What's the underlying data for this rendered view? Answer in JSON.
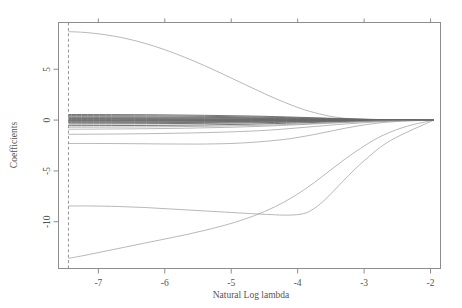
{
  "chart_data": {
    "type": "line",
    "title": "",
    "xlabel": "Natural Log lambda",
    "ylabel": "Coefficients",
    "xlim": [
      -7.6,
      -1.85
    ],
    "ylim": [
      -14.6,
      9.6
    ],
    "grid": false,
    "legend": false,
    "legend_position": "none",
    "xticks": [
      -7,
      -6,
      -5,
      -4,
      -3,
      -2
    ],
    "xtick_labels": [
      "-7",
      "-6",
      "-5",
      "-4",
      "-3",
      "-2"
    ],
    "yticks": [
      5,
      0,
      -5,
      -10
    ],
    "ytick_labels": [
      "5",
      "0",
      "-5",
      "-10"
    ],
    "top_axis_ticks": [
      -7,
      -6,
      -5,
      -4,
      -3,
      -2
    ],
    "top_axis_labels": [
      "",
      "",
      "",
      "",
      "",
      ""
    ],
    "annotations": [
      {
        "name": "lambda-min-line",
        "type": "vline",
        "x": -7.45,
        "style": "dashed"
      }
    ],
    "series": [
      {
        "name": "coef_1_large_positive",
        "x": [
          -7.45,
          -7.2,
          -6.9,
          -6.6,
          -6.3,
          -6.0,
          -5.7,
          -5.4,
          -5.1,
          -4.8,
          -4.5,
          -4.2,
          -3.9,
          -3.6,
          -3.35,
          -3.1,
          -2.8,
          -2.4,
          -1.95
        ],
        "values": [
          8.7,
          8.62,
          8.4,
          8.05,
          7.55,
          6.92,
          6.18,
          5.35,
          4.45,
          3.52,
          2.6,
          1.75,
          1.02,
          0.5,
          0.22,
          0.1,
          0.04,
          0.01,
          0.0
        ]
      },
      {
        "name": "coef_2_deep_negative",
        "x": [
          -7.45,
          -7.2,
          -6.9,
          -6.6,
          -6.3,
          -6.0,
          -5.7,
          -5.4,
          -5.1,
          -4.8,
          -4.5,
          -4.2,
          -3.9,
          -3.6,
          -3.3,
          -3.0,
          -2.7,
          -2.35,
          -1.95
        ],
        "values": [
          -13.6,
          -13.3,
          -12.9,
          -12.5,
          -12.1,
          -11.7,
          -11.3,
          -10.85,
          -10.35,
          -9.75,
          -9.0,
          -8.05,
          -6.85,
          -5.4,
          -3.9,
          -2.55,
          -1.45,
          -0.6,
          0.0
        ]
      },
      {
        "name": "coef_3_mid_negative",
        "x": [
          -7.45,
          -7.1,
          -6.7,
          -6.3,
          -5.9,
          -5.5,
          -5.1,
          -4.7,
          -4.4,
          -4.15,
          -3.95,
          -3.8,
          -3.6,
          -3.3,
          -3.0,
          -2.6,
          -1.95
        ],
        "values": [
          -8.45,
          -8.45,
          -8.5,
          -8.6,
          -8.75,
          -8.9,
          -9.05,
          -9.2,
          -9.3,
          -9.35,
          -9.25,
          -8.9,
          -7.9,
          -5.9,
          -4.0,
          -2.0,
          0.0
        ]
      },
      {
        "name": "coef_4_small_negative",
        "x": [
          -7.45,
          -7.0,
          -6.5,
          -6.0,
          -5.5,
          -5.0,
          -4.6,
          -4.2,
          -3.9,
          -3.6,
          -3.3,
          -3.0,
          -2.6,
          -1.95
        ],
        "values": [
          -2.3,
          -2.3,
          -2.32,
          -2.35,
          -2.36,
          -2.3,
          -2.15,
          -1.9,
          -1.6,
          -1.22,
          -0.82,
          -0.48,
          -0.18,
          0.0
        ]
      },
      {
        "name": "coef_5_small_negative",
        "x": [
          -7.45,
          -6.9,
          -6.3,
          -5.7,
          -5.1,
          -4.6,
          -4.2,
          -3.8,
          -3.4,
          -3.0,
          -2.5,
          -1.95
        ],
        "values": [
          -1.4,
          -1.38,
          -1.34,
          -1.28,
          -1.18,
          -1.05,
          -0.88,
          -0.66,
          -0.44,
          -0.26,
          -0.08,
          0.0
        ]
      },
      {
        "name": "coef_6_small_negative",
        "x": [
          -7.45,
          -6.9,
          -6.3,
          -5.7,
          -5.1,
          -4.5,
          -4.0,
          -3.5,
          -3.0,
          -2.5,
          -1.95
        ],
        "values": [
          -0.9,
          -0.88,
          -0.85,
          -0.8,
          -0.72,
          -0.6,
          -0.46,
          -0.3,
          -0.16,
          -0.05,
          0.0
        ]
      },
      {
        "name": "coef_7_near_zero",
        "x": [
          -7.45,
          -6.8,
          -6.1,
          -5.4,
          -4.7,
          -4.0,
          -3.4,
          -2.8,
          -1.95
        ],
        "values": [
          -0.55,
          -0.54,
          -0.52,
          -0.48,
          -0.4,
          -0.28,
          -0.16,
          -0.06,
          0.0
        ]
      },
      {
        "name": "coef_8_near_zero",
        "x": [
          -7.45,
          -6.8,
          -6.1,
          -5.4,
          -4.7,
          -4.0,
          -3.4,
          -2.8,
          -1.95
        ],
        "values": [
          -0.38,
          -0.37,
          -0.35,
          -0.32,
          -0.27,
          -0.19,
          -0.11,
          -0.04,
          0.0
        ]
      },
      {
        "name": "coef_9_near_zero",
        "x": [
          -7.45,
          -6.8,
          -6.1,
          -5.4,
          -4.7,
          -4.0,
          -3.4,
          -2.8,
          -1.95
        ],
        "values": [
          -0.26,
          -0.26,
          -0.25,
          -0.23,
          -0.19,
          -0.14,
          -0.08,
          -0.03,
          0.0
        ]
      },
      {
        "name": "coef_10_near_zero",
        "x": [
          -7.45,
          -6.8,
          -6.1,
          -5.4,
          -4.7,
          -4.0,
          -3.4,
          -2.8,
          -1.95
        ],
        "values": [
          -0.18,
          -0.18,
          -0.17,
          -0.15,
          -0.13,
          -0.09,
          -0.05,
          -0.02,
          0.0
        ]
      },
      {
        "name": "coef_11_near_zero",
        "x": [
          -7.45,
          -6.8,
          -6.1,
          -5.4,
          -4.7,
          -4.0,
          -3.4,
          -2.8,
          -1.95
        ],
        "values": [
          -0.1,
          -0.1,
          -0.09,
          -0.08,
          -0.07,
          -0.05,
          -0.03,
          -0.01,
          0.0
        ]
      },
      {
        "name": "coef_12_near_zero",
        "x": [
          -7.45,
          -6.8,
          -6.1,
          -5.4,
          -4.7,
          -4.0,
          -3.4,
          -2.8,
          -1.95
        ],
        "values": [
          -0.05,
          -0.05,
          -0.05,
          -0.04,
          -0.03,
          -0.02,
          -0.01,
          0.0,
          0.0
        ]
      },
      {
        "name": "coef_13_near_zero",
        "x": [
          -7.45,
          -6.8,
          -6.1,
          -5.4,
          -4.7,
          -4.0,
          -3.4,
          -2.8,
          -1.95
        ],
        "values": [
          0.02,
          0.02,
          0.02,
          0.02,
          0.01,
          0.01,
          0.0,
          0.0,
          0.0
        ]
      },
      {
        "name": "coef_14_near_zero",
        "x": [
          -7.45,
          -6.8,
          -6.1,
          -5.4,
          -4.7,
          -4.0,
          -3.4,
          -2.8,
          -1.95
        ],
        "values": [
          0.08,
          0.08,
          0.07,
          0.07,
          0.06,
          0.04,
          0.02,
          0.01,
          0.0
        ]
      },
      {
        "name": "coef_15_near_zero",
        "x": [
          -7.45,
          -6.8,
          -6.1,
          -5.4,
          -4.7,
          -4.0,
          -3.4,
          -2.8,
          -1.95
        ],
        "values": [
          0.15,
          0.15,
          0.14,
          0.13,
          0.11,
          0.08,
          0.04,
          0.02,
          0.0
        ]
      },
      {
        "name": "coef_16_near_zero",
        "x": [
          -7.45,
          -6.8,
          -6.1,
          -5.4,
          -4.7,
          -4.0,
          -3.4,
          -2.8,
          -1.95
        ],
        "values": [
          0.23,
          0.23,
          0.22,
          0.2,
          0.17,
          0.12,
          0.07,
          0.03,
          0.0
        ]
      },
      {
        "name": "coef_17_near_zero",
        "x": [
          -7.45,
          -6.8,
          -6.1,
          -5.4,
          -4.7,
          -4.0,
          -3.4,
          -2.8,
          -1.95
        ],
        "values": [
          0.32,
          0.32,
          0.3,
          0.27,
          0.23,
          0.16,
          0.09,
          0.04,
          0.0
        ]
      },
      {
        "name": "coef_18_near_zero",
        "x": [
          -7.45,
          -6.8,
          -6.1,
          -5.4,
          -4.7,
          -4.0,
          -3.4,
          -2.8,
          -1.95
        ],
        "values": [
          0.44,
          0.43,
          0.41,
          0.37,
          0.31,
          0.22,
          0.13,
          0.05,
          0.0
        ]
      },
      {
        "name": "coef_19_near_zero",
        "x": [
          -7.45,
          -6.8,
          -6.1,
          -5.4,
          -4.7,
          -4.0,
          -3.4,
          -2.8,
          -1.95
        ],
        "values": [
          -0.7,
          -0.69,
          -0.66,
          -0.61,
          -0.53,
          -0.39,
          -0.24,
          -0.09,
          0.0
        ]
      },
      {
        "name": "coef_20_near_zero",
        "x": [
          -7.45,
          -6.8,
          -6.1,
          -5.4,
          -4.7,
          -4.0,
          -3.4,
          -2.8,
          -1.95
        ],
        "values": [
          0.55,
          0.54,
          0.52,
          0.47,
          0.4,
          0.28,
          0.16,
          0.06,
          0.0
        ]
      }
    ]
  }
}
